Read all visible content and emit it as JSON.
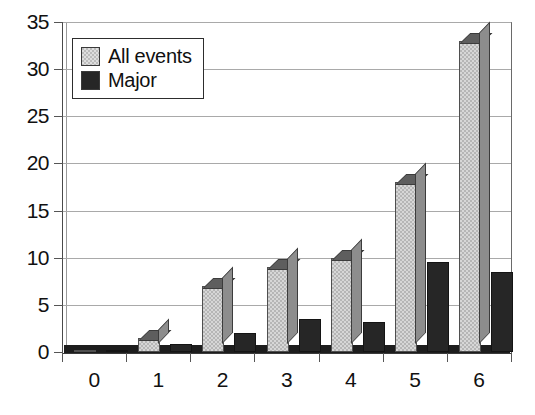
{
  "chart_data": {
    "type": "bar",
    "title": "",
    "subtitle": "",
    "xlabel": "",
    "ylabel": "",
    "xlim": [
      -0.5,
      6.5
    ],
    "ylim": [
      0,
      35
    ],
    "grid": true,
    "grid_axis": "y",
    "legend_position": "upper-left-inside",
    "style": "3d-column",
    "categories": [
      "0",
      "1",
      "2",
      "3",
      "4",
      "5",
      "6"
    ],
    "yticks": [
      "0",
      "5",
      "10",
      "15",
      "20",
      "25",
      "30",
      "35"
    ],
    "ytick_values": [
      0,
      5,
      10,
      15,
      20,
      25,
      30,
      35
    ],
    "series": [
      {
        "name": "All events",
        "color": "#b6b6b6",
        "values": [
          0.2,
          1.5,
          7,
          9,
          10,
          18,
          33
        ]
      },
      {
        "name": "Major",
        "color": "#262626",
        "values": [
          0.2,
          0.8,
          2,
          3.5,
          3.2,
          9.5,
          8.5
        ]
      }
    ]
  },
  "legend": {
    "items": [
      {
        "label": "All events",
        "swatch": "light-gray"
      },
      {
        "label": "Major",
        "swatch": "dark-gray"
      }
    ]
  },
  "colors": {
    "series_all_events": "#b6b6b6",
    "series_major": "#262626",
    "gridline": "#a9a9a9",
    "axis": "#3a3a3a",
    "background": "#ffffff",
    "text": "#111111"
  }
}
